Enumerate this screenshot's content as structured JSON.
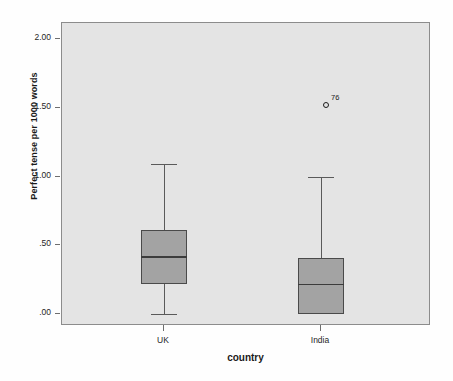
{
  "chart_data": {
    "type": "boxplot",
    "title": "",
    "xlabel": "country",
    "ylabel": "Perfect tense per 1000 words",
    "categories": [
      "UK",
      "India"
    ],
    "ylim": [
      -0.1,
      2.12
    ],
    "yticks": [
      0.0,
      0.5,
      1.0,
      1.5,
      2.0
    ],
    "ytick_labels": [
      ".00",
      ".50",
      "1.00",
      "1.50",
      "2.00"
    ],
    "grid": false,
    "legend": "none",
    "boxes": [
      {
        "category": "UK",
        "whisker_low": 0.0,
        "q1": 0.22,
        "median": 0.42,
        "q3": 0.61,
        "whisker_high": 1.09,
        "outliers": []
      },
      {
        "category": "India",
        "whisker_low": 0.0,
        "q1": 0.0,
        "median": 0.22,
        "q3": 0.41,
        "whisker_high": 1.0,
        "outliers": [
          {
            "value": 1.52,
            "label": "76"
          }
        ]
      }
    ],
    "colors": {
      "box_fill": "#a3a3a3",
      "box_edge": "#4a4a4a",
      "median": "#3c3c3c",
      "whisker": "#5a5a5a",
      "plot_background": "#e4e4e4",
      "frame": "#8c8c8c",
      "text": "#1a1a1a"
    }
  }
}
